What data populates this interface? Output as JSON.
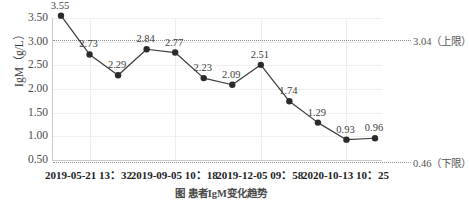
{
  "chart_data": {
    "type": "line",
    "title": "",
    "xlabel": "",
    "ylabel": "IgM（g/L）",
    "ylim": [
      0.5,
      3.5
    ],
    "y_ticks": [
      "0.50",
      "1.00",
      "1.50",
      "2.00",
      "2.50",
      "3.00",
      "3.50"
    ],
    "y_tick_values": [
      0.5,
      1.0,
      1.5,
      2.0,
      2.5,
      3.0,
      3.5
    ],
    "grid": true,
    "legend": "none",
    "x": [
      1,
      2,
      3,
      4,
      5,
      6,
      7,
      8,
      9,
      10,
      11,
      12
    ],
    "values": [
      3.55,
      2.73,
      2.29,
      2.84,
      2.77,
      2.23,
      2.09,
      2.51,
      1.74,
      1.29,
      0.93,
      0.96
    ],
    "point_labels": [
      "3.55",
      "2.73",
      "2.29",
      "2.84",
      "2.77",
      "2.23",
      "2.09",
      "2.51",
      "1.74",
      "1.29",
      "0.93",
      "0.96"
    ],
    "x_tick_labels": [
      "2019-05-21 13：32",
      "2019-09-05 10：18",
      "2019-12-05 09：58",
      "2020-10-13 10：25"
    ],
    "x_tick_positions": [
      1,
      4,
      7,
      10
    ],
    "reference_lines": [
      {
        "name": "upper-limit",
        "value": 3.04,
        "label": "3.04（上限）",
        "style": "dotted"
      },
      {
        "name": "lower-limit",
        "value": 0.46,
        "label": "0.46（下限）",
        "style": "dotted"
      }
    ],
    "colors": {
      "series": "#3a3a3a",
      "marker": "#2b2b2b",
      "gridline": "#efefef",
      "reference": "#8c8c8c",
      "axis": "#c9c9c9",
      "text": "#3a3a3a"
    }
  },
  "caption": "图  患者IgM变化趋势"
}
